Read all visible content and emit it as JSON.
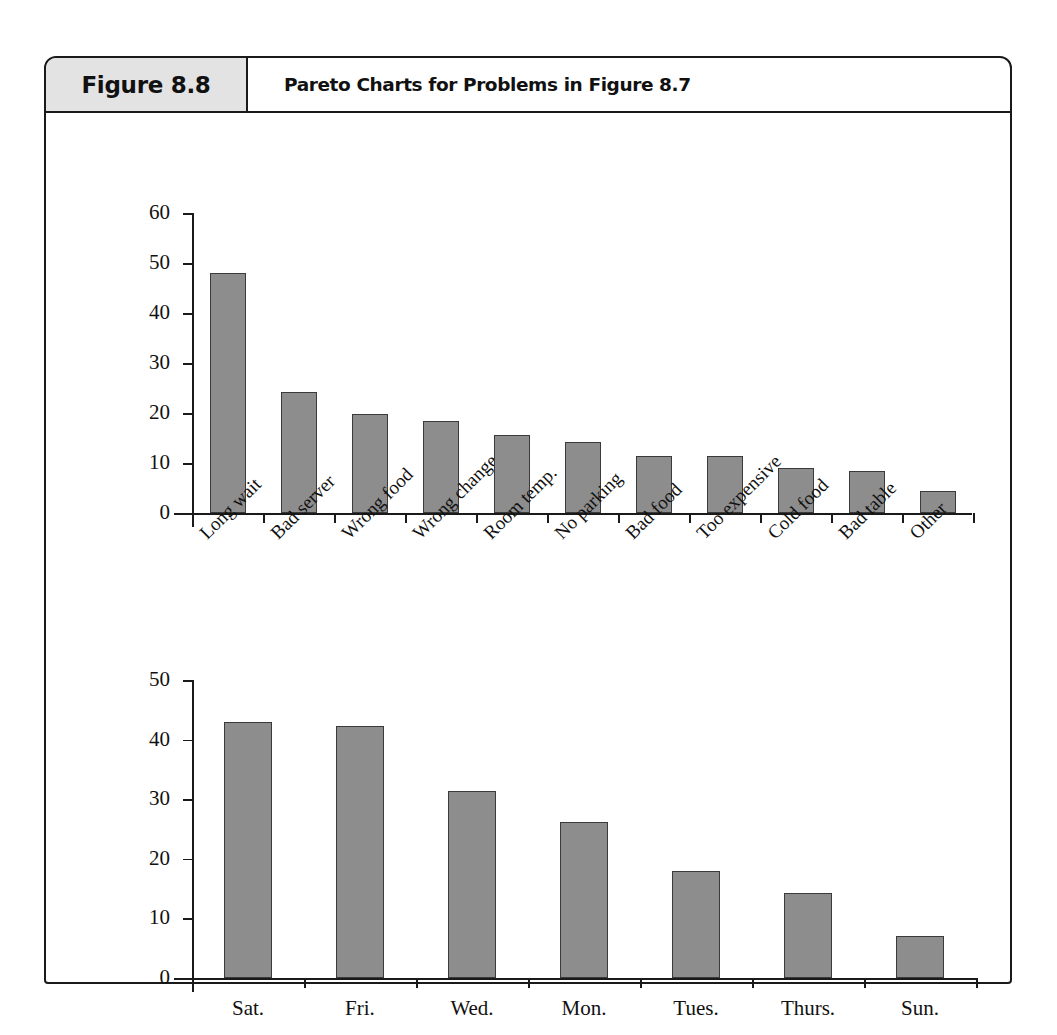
{
  "figure": {
    "number": "Figure 8.8",
    "caption": "Pareto Charts for Problems in Figure 8.7"
  },
  "colors": {
    "bar_fill": "#8d8d8d",
    "bar_stroke": "#3a3a3a",
    "axis": "#1a1a1a",
    "header_band": "#e3e3e3"
  },
  "chart_data": [
    {
      "type": "bar",
      "title": "",
      "xlabel": "",
      "ylabel": "",
      "ylim": [
        0,
        60
      ],
      "yticks": [
        0,
        10,
        20,
        30,
        40,
        50,
        60
      ],
      "grid": false,
      "legend": "none",
      "label_rotation": -45,
      "categories": [
        "Long wait",
        "Bad server",
        "Wrong food",
        "Wrong change",
        "Room temp.",
        "No parking",
        "Bad food",
        "Too expensive",
        "Cold food",
        "Bad table",
        "Other"
      ],
      "values": [
        48,
        24.3,
        19.8,
        18.5,
        15.6,
        14.3,
        11.4,
        11.4,
        9.1,
        8.5,
        4.4
      ]
    },
    {
      "type": "bar",
      "title": "",
      "xlabel": "",
      "ylabel": "",
      "ylim": [
        0,
        50
      ],
      "yticks": [
        0,
        10,
        20,
        30,
        40,
        50
      ],
      "grid": false,
      "legend": "none",
      "label_rotation": 0,
      "categories": [
        "Sat.",
        "Fri.",
        "Wed.",
        "Mon.",
        "Tues.",
        "Thurs.",
        "Sun."
      ],
      "values": [
        43,
        42.2,
        31.3,
        26.2,
        18,
        14.2,
        7
      ]
    }
  ]
}
